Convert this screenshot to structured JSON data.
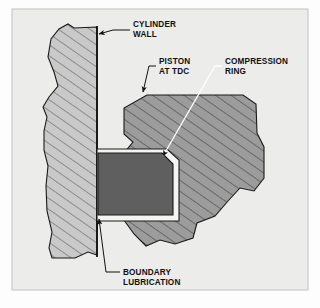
{
  "figure": {
    "background_color": "#fdfdfd",
    "panel_color": "#ececeb",
    "panel_border_color": "#b9b9b9"
  },
  "parts": {
    "cylinder_wall": {
      "name": "cylinder-wall",
      "fill": "#c9c9c9",
      "hatch_color": "#555555",
      "outline_color": "#1a1a1a"
    },
    "bore_line": {
      "name": "bore-line",
      "color": "#111111"
    },
    "piston": {
      "name": "piston-at-tdc",
      "fill": "#9a9a9a",
      "hatch_color": "#3a3a3a",
      "outline_color": "#1a1a1a"
    },
    "ring_groove": {
      "name": "ring-groove",
      "fill": "#f4f4f2",
      "outline_color": "#1a1a1a"
    },
    "compression_ring": {
      "name": "compression-ring",
      "fill": "#5f5f5f",
      "outline_color": "#1a1a1a"
    }
  },
  "labels": [
    {
      "id": "cylinder-wall",
      "line1": "CYLINDER",
      "line2": "WALL",
      "leader_color": "#111111",
      "has_arrow": true
    },
    {
      "id": "piston-at-tdc",
      "line1": "PISTON",
      "line2": "AT TDC",
      "leader_color": "#111111",
      "has_arrow": true
    },
    {
      "id": "compression-ring",
      "line1": "COMPRESSION",
      "line2": "RING",
      "leader_color": "#ffffff",
      "has_arrow": true
    },
    {
      "id": "boundary-lubrication",
      "line1": "BOUNDARY",
      "line2": "LUBRICATION",
      "leader_color": "#111111",
      "has_arrow": true
    }
  ]
}
